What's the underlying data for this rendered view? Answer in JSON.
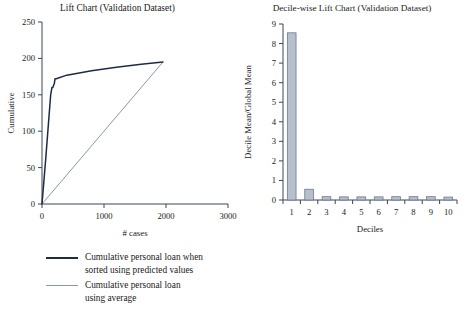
{
  "chart_data": [
    {
      "type": "line",
      "id": "lift-chart",
      "title": "Lift Chart (Validation Dataset)",
      "xlabel": "# cases",
      "ylabel": "Cumulative",
      "xlim": [
        0,
        3000
      ],
      "ylim": [
        0,
        250
      ],
      "xticks": [
        0,
        1000,
        2000,
        3000
      ],
      "yticks": [
        0,
        50,
        100,
        150,
        200,
        250
      ],
      "grid": false,
      "legend_position": "below-left",
      "series": [
        {
          "name": "Cumulative personal loan when sorted using predicted values",
          "color": "#1f2a44",
          "x": [
            0,
            60,
            140,
            160,
            175,
            200,
            210,
            230,
            400,
            800,
            1200,
            1600,
            1950
          ],
          "y": [
            0,
            62,
            150,
            160,
            160,
            166,
            172,
            172,
            177,
            183,
            188,
            192,
            195
          ]
        },
        {
          "name": "Cumulative personal loan using average",
          "color": "#8a97ad",
          "x": [
            0,
            1950
          ],
          "y": [
            0,
            195
          ]
        }
      ]
    },
    {
      "type": "bar",
      "id": "decile-wise-lift-chart",
      "title": "Decile-wise Lift Chart (Validation Dataset)",
      "xlabel": "Deciles",
      "ylabel": "Decile Mean/Global Mean",
      "categories": [
        "1",
        "2",
        "3",
        "4",
        "5",
        "6",
        "7",
        "8",
        "9",
        "10"
      ],
      "values": [
        8.55,
        0.55,
        0.17,
        0.16,
        0.16,
        0.16,
        0.17,
        0.17,
        0.17,
        0.15
      ],
      "ylim": [
        0,
        9
      ],
      "yticks": [
        0,
        1,
        2,
        3,
        4,
        5,
        6,
        7,
        8,
        9
      ],
      "grid": false,
      "bar_color": "#b6bfcb",
      "bar_border_color": "#6d7b90"
    }
  ],
  "legend": {
    "entries": [
      {
        "label": "Cumulative personal loan when\nsorted using predicted values",
        "swatch": "line-dark-navy"
      },
      {
        "label": "Cumulative personal loan\nusing average",
        "swatch": "line-light-steel"
      }
    ]
  }
}
